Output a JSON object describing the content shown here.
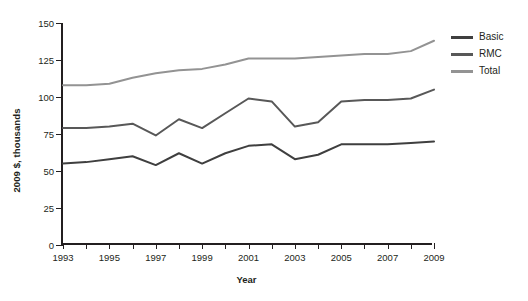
{
  "chart_data": {
    "type": "line",
    "title": "",
    "xlabel": "Year",
    "ylabel": "2009 $, thousands",
    "x": [
      1993,
      1994,
      1995,
      1996,
      1997,
      1998,
      1999,
      2000,
      2001,
      2002,
      2003,
      2004,
      2005,
      2006,
      2007,
      2008,
      2009
    ],
    "xlim": [
      1993,
      2009
    ],
    "ylim": [
      0,
      150
    ],
    "yticks": [
      0,
      25,
      50,
      75,
      100,
      125,
      150
    ],
    "xticks_labeled": [
      1993,
      1995,
      1997,
      1999,
      2001,
      2003,
      2005,
      2007,
      2009
    ],
    "grid": false,
    "legend_position": "right",
    "series": [
      {
        "name": "Basic",
        "color": "#3f3f3f",
        "values": [
          55,
          56,
          58,
          60,
          54,
          62,
          55,
          62,
          67,
          68,
          58,
          61,
          68,
          68,
          68,
          69,
          70
        ]
      },
      {
        "name": "RMC",
        "color": "#585858",
        "values": [
          79,
          79,
          80,
          82,
          74,
          85,
          79,
          89,
          99,
          97,
          80,
          83,
          97,
          98,
          98,
          99,
          105
        ]
      },
      {
        "name": "Total",
        "color": "#939393",
        "values": [
          108,
          108,
          109,
          113,
          116,
          118,
          119,
          122,
          126,
          126,
          126,
          127,
          128,
          129,
          129,
          131,
          138
        ]
      }
    ]
  },
  "axes": {
    "y_title": "2009 $, thousands",
    "x_title": "Year",
    "y_tick_labels": [
      "0",
      "25",
      "50",
      "75",
      "100",
      "125",
      "150"
    ],
    "x_tick_labels": [
      "1993",
      "1995",
      "1997",
      "1999",
      "2001",
      "2003",
      "2005",
      "2007",
      "2009"
    ]
  },
  "legend": {
    "items": [
      {
        "label": "Basic",
        "color": "#3f3f3f"
      },
      {
        "label": "RMC",
        "color": "#585858"
      },
      {
        "label": "Total",
        "color": "#939393"
      }
    ]
  }
}
